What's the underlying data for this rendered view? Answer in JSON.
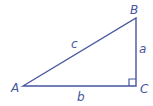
{
  "diagram": {
    "type": "right-triangle",
    "color": "#4656a0",
    "vertices": {
      "A": {
        "label": "A"
      },
      "B": {
        "label": "B"
      },
      "C": {
        "label": "C"
      }
    },
    "sides": {
      "a": {
        "label": "a",
        "between": "B-C"
      },
      "b": {
        "label": "b",
        "between": "A-C"
      },
      "c": {
        "label": "c",
        "between": "A-B"
      }
    },
    "right_angle_at": "C"
  }
}
